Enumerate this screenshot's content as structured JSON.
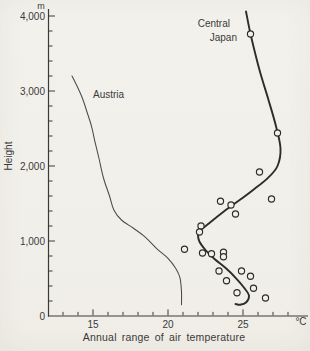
{
  "ui": {
    "austria_label": "Austria",
    "japan_label_line1": "Central",
    "japan_label_line2": "Japan",
    "height_axis_label": "Height",
    "height_unit": "m",
    "temp_unit": "°C",
    "x_axis_title": "Annual range of air temperature"
  },
  "colors": {
    "paper": "#f2f0ea",
    "ink": "#3a3a3a",
    "austria_curve": "#4a4a48",
    "japan_curve": "#2d2c2a",
    "point_fill": "#f2f0ea"
  },
  "chart_data": {
    "type": "line",
    "title": "Annual range of air temperature",
    "xlabel": "Annual range of air temperature",
    "ylabel": "Height",
    "x_unit": "°C",
    "y_unit": "m",
    "xlim": [
      12,
      28.7
    ],
    "ylim": [
      0,
      4100
    ],
    "grid": false,
    "legend_position": "inline-labels",
    "x_major_ticks": [
      15,
      20,
      25
    ],
    "x_major_tick_labels": [
      "15",
      "20",
      "25"
    ],
    "x_minor_tick_start": 13,
    "x_minor_tick_end": 28,
    "x_minor_step": 1,
    "y_major_ticks": [
      0,
      1000,
      2000,
      3000,
      4000
    ],
    "y_major_tick_labels": [
      "0",
      "1,000",
      "2,000",
      "3,000",
      "4,000"
    ],
    "y_minor_step": 200,
    "series": [
      {
        "name": "Austria",
        "style": "thin-line",
        "points_temp_height": [
          [
            13.6,
            3200
          ],
          [
            13.9,
            3080
          ],
          [
            14.3,
            2900
          ],
          [
            14.6,
            2720
          ],
          [
            14.9,
            2530
          ],
          [
            15.1,
            2350
          ],
          [
            15.4,
            2100
          ],
          [
            15.7,
            1840
          ],
          [
            16.1,
            1600
          ],
          [
            16.4,
            1410
          ],
          [
            16.9,
            1280
          ],
          [
            17.7,
            1170
          ],
          [
            18.5,
            1050
          ],
          [
            19.3,
            890
          ],
          [
            20.0,
            770
          ],
          [
            20.5,
            640
          ],
          [
            20.8,
            510
          ],
          [
            20.9,
            320
          ],
          [
            20.9,
            150
          ]
        ]
      },
      {
        "name": "Central Japan",
        "style": "thick-line-with-open-circles",
        "curve_temp_height": [
          [
            25.2,
            4060
          ],
          [
            25.5,
            3760
          ],
          [
            26.1,
            3280
          ],
          [
            26.7,
            2880
          ],
          [
            27.2,
            2530
          ],
          [
            27.5,
            2230
          ],
          [
            27.3,
            2000
          ],
          [
            26.7,
            1850
          ],
          [
            25.8,
            1700
          ],
          [
            24.8,
            1550
          ],
          [
            23.7,
            1390
          ],
          [
            22.7,
            1230
          ],
          [
            22.1,
            1130
          ],
          [
            22.0,
            1080
          ],
          [
            22.1,
            990
          ],
          [
            22.5,
            880
          ],
          [
            23.1,
            760
          ],
          [
            23.9,
            630
          ],
          [
            24.6,
            490
          ],
          [
            25.1,
            370
          ],
          [
            25.4,
            270
          ],
          [
            25.2,
            180
          ],
          [
            24.8,
            150
          ],
          [
            24.5,
            160
          ]
        ],
        "scatter_temp_height": [
          [
            25.5,
            3760
          ],
          [
            27.3,
            2440
          ],
          [
            26.1,
            1920
          ],
          [
            26.9,
            1560
          ],
          [
            23.5,
            1530
          ],
          [
            24.2,
            1480
          ],
          [
            24.5,
            1360
          ],
          [
            22.2,
            1200
          ],
          [
            22.1,
            1120
          ],
          [
            21.1,
            890
          ],
          [
            22.3,
            840
          ],
          [
            22.9,
            830
          ],
          [
            23.7,
            850
          ],
          [
            23.7,
            790
          ],
          [
            23.4,
            600
          ],
          [
            24.9,
            600
          ],
          [
            25.5,
            530
          ],
          [
            23.9,
            470
          ],
          [
            25.7,
            370
          ],
          [
            24.6,
            310
          ],
          [
            26.5,
            240
          ]
        ]
      }
    ]
  }
}
